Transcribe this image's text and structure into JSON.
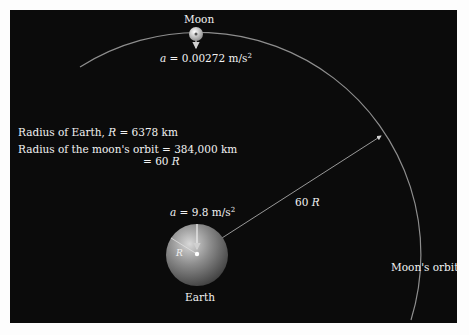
{
  "moon": {
    "label": "Moon",
    "accel_prefix": "a",
    "accel_value": "= 0.00272 m/s",
    "accel_exp": "2"
  },
  "earth": {
    "label": "Earth",
    "radius_symbol": "R",
    "accel_prefix": "a",
    "accel_value": "= 9.8 m/s",
    "accel_exp": "2"
  },
  "info": {
    "earth_radius_text": "Radius of Earth,",
    "earth_radius_symbol": "R",
    "earth_radius_value": "= 6378 km",
    "orbit_radius_text": "Radius of the moon's orbit = 384,000 km",
    "orbit_radius_equiv_prefix": "= 60",
    "orbit_radius_equiv_symbol": "R"
  },
  "distance_label": {
    "number": "60",
    "symbol": "R"
  },
  "orbit_label": "Moon's orbit",
  "colors": {
    "background": "#0b0b0b",
    "text": "#f2f2f2",
    "orbit": "#9a9a9a",
    "earth": "#8a8a8a"
  }
}
